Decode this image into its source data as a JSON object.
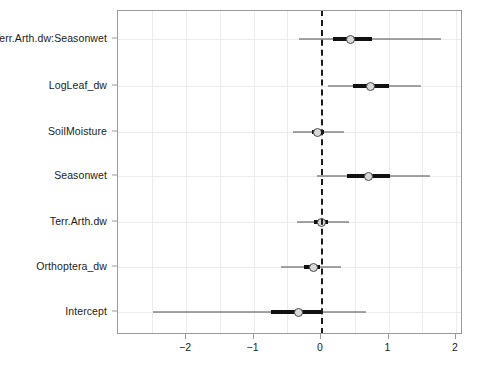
{
  "chart_data": {
    "type": "scatter",
    "title": "",
    "subtitle": "",
    "xlabel": "",
    "ylabel": "",
    "xlim": [
      -2.57,
      2.1
    ],
    "ylim": [
      0,
      7
    ],
    "grid": true,
    "legend": "none",
    "reference_line": 0,
    "reference_line_style": "dashed",
    "xticks": [
      -2,
      -1,
      0,
      1,
      2
    ],
    "xtick_labels": [
      "−2",
      "−1",
      "0",
      "1",
      "2"
    ],
    "categories": [
      "Terr.Arth.dw:Seasonwet",
      "LogLeaf_dw",
      "SoilMoisture",
      "Seasonwet",
      "Terr.Arth.dw",
      "Orthoptera_dw",
      "Intercept"
    ],
    "series": [
      {
        "name": "coefficient estimates",
        "points": [
          {
            "label": "Terr.Arth.dw:Seasonwet",
            "estimate": 0.44,
            "inner_low": 0.18,
            "inner_high": 0.75,
            "outer_low": -0.32,
            "outer_high": 1.78
          },
          {
            "label": "LogLeaf_dw",
            "estimate": 0.74,
            "inner_low": 0.48,
            "inner_high": 1.01,
            "outer_low": 0.1,
            "outer_high": 1.48
          },
          {
            "label": "SoilMoisture",
            "estimate": -0.05,
            "inner_low": -0.14,
            "inner_high": 0.05,
            "outer_low": -0.42,
            "outer_high": 0.34
          },
          {
            "label": "Seasonwet",
            "estimate": 0.7,
            "inner_low": 0.39,
            "inner_high": 1.02,
            "outer_low": -0.06,
            "outer_high": 1.62
          },
          {
            "label": "Terr.Arth.dw",
            "estimate": 0.0,
            "inner_low": -0.1,
            "inner_high": 0.1,
            "outer_low": -0.36,
            "outer_high": 0.42
          },
          {
            "label": "Orthoptera_dw",
            "estimate": -0.11,
            "inner_low": -0.25,
            "inner_high": -0.02,
            "outer_low": -0.6,
            "outer_high": 0.29
          },
          {
            "label": "Intercept",
            "estimate": -0.34,
            "inner_low": -0.74,
            "inner_high": 0.0,
            "outer_low": -2.49,
            "outer_high": 0.67
          }
        ]
      }
    ],
    "colors": {
      "point_fill": "#d9d9d9",
      "point_border": "#4a4a4a",
      "inner_interval": "#111111",
      "outer_interval": "#4d4d4d",
      "reference_line": "#1a1a1a",
      "grid": "#ececec",
      "frame": "#9b9b9b",
      "text": "#1c1c1c"
    }
  }
}
